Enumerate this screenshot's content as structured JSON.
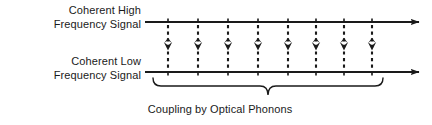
{
  "figure": {
    "width": 432,
    "height": 125,
    "background_color": "#ffffff",
    "stroke_color": "#1a1a1a",
    "text_color": "#1a1a1a"
  },
  "labels": {
    "high_signal": {
      "line1": "Coherent High",
      "line2": "Frequency Signal"
    },
    "low_signal": {
      "line1": "Coherent  Low",
      "line2": "Frequency Signal"
    }
  },
  "caption": {
    "text": "Coupling by Optical Phonons"
  },
  "chart_data": {
    "type": "diagram",
    "title": "",
    "axes": [
      {
        "name": "coherent-high-frequency-signal",
        "label": "Coherent High Frequency Signal",
        "orientation": "horizontal",
        "y": 22,
        "x_start": 145,
        "x_end": 424,
        "arrowhead": "right",
        "tick_count": 8
      },
      {
        "name": "coherent-low-frequency-signal",
        "label": "Coherent Low Frequency Signal",
        "orientation": "horizontal",
        "y": 72,
        "x_start": 145,
        "x_end": 424,
        "arrowhead": "right",
        "tick_count": 8
      }
    ],
    "couplings": {
      "count": 8,
      "style": "dashed-double-headed-vertical-arrow",
      "y_top": 22,
      "y_bottom": 72,
      "x_positions": [
        168,
        198,
        228,
        258,
        288,
        316,
        344,
        372
      ]
    },
    "brace": {
      "label": "Coupling by Optical Phonons",
      "x_start": 153,
      "x_end": 383,
      "y": 78,
      "direction": "down"
    }
  }
}
